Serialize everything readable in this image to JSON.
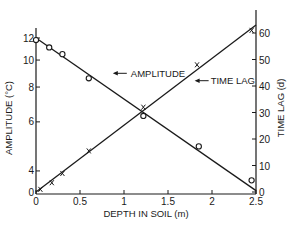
{
  "chart_data": {
    "type": "line",
    "title": "",
    "xlabel": "DEPTH IN SOIL (m)",
    "ylabel": "AMPLITUDE (°C)",
    "y2label": "TIME LAG (d)",
    "xlim": [
      0,
      2.5
    ],
    "ylim": [
      3,
      12.2
    ],
    "y_scale": "log",
    "y2lim": [
      0,
      65
    ],
    "grid": false,
    "legend": "inline annotations",
    "x_ticks": [
      0,
      0.5,
      1,
      1.5,
      2,
      2.5
    ],
    "x_tick_labels": [
      "0",
      "0.5",
      "1",
      "1.5",
      "2",
      "2.5"
    ],
    "y_ticks": [
      4,
      6,
      8,
      10,
      12
    ],
    "y_tick_labels": [
      "4",
      "6",
      "8",
      "10",
      "12"
    ],
    "y_origin_label": "0",
    "y2_ticks": [
      0,
      10,
      20,
      30,
      40,
      50,
      60
    ],
    "y2_tick_labels": [
      "0",
      "10",
      "20",
      "30",
      "40",
      "50",
      "60"
    ],
    "series": [
      {
        "name": "AMPLITUDE",
        "axis": "left",
        "marker": "circle",
        "x": [
          0.0,
          0.15,
          0.3,
          0.6,
          1.22,
          1.85,
          2.45
        ],
        "values": [
          11.8,
          11.1,
          10.5,
          8.6,
          6.3,
          4.9,
          3.7
        ],
        "fit_line": {
          "x": [
            0.0,
            2.5
          ],
          "y": [
            12.0,
            3.4
          ]
        }
      },
      {
        "name": "TIME LAG",
        "axis": "right",
        "marker": "x",
        "x": [
          0.05,
          0.18,
          0.3,
          0.6,
          1.22,
          1.83,
          2.45
        ],
        "values": [
          1,
          3.5,
          7,
          15.5,
          32,
          48,
          61
        ],
        "fit_line": {
          "x": [
            0.0,
            2.5
          ],
          "y": [
            0,
            63
          ]
        }
      }
    ],
    "annotations": [
      {
        "text": "AMPLITUDE",
        "arrow_to": [
          0.85,
          8.6
        ]
      },
      {
        "text": "TIME LAG",
        "arrow_to": [
          1.78,
          42
        ]
      }
    ]
  }
}
